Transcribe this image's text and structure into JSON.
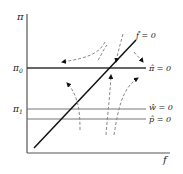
{
  "diagram": {
    "axes": {
      "y_label": "π",
      "x_label": "f"
    },
    "levels": {
      "pi0_label": "π",
      "pi0_sub": "0",
      "pi1_label": "π",
      "pi1_sub": "1"
    },
    "curves": {
      "f_hat_label": "f̂ = 0",
      "pi_hat_label": "π̂ = 0",
      "w_hat_label": "ŵ = 0",
      "p_hat_label": "p̂ = 0"
    },
    "colors": {
      "line": "#222222",
      "axis": "#555555",
      "hline": "#777777",
      "dashed": "#888888"
    }
  }
}
